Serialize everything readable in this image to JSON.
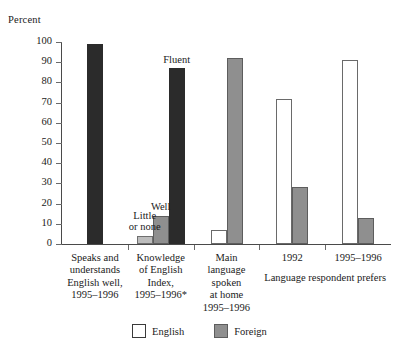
{
  "chart_data": {
    "type": "bar",
    "title": "",
    "xlabel": "",
    "ylabel": "Percent",
    "ylim": [
      0,
      100
    ],
    "yticks": [
      0,
      10,
      20,
      30,
      40,
      50,
      60,
      70,
      80,
      90,
      100
    ],
    "ytick_labels": [
      "0",
      "10",
      "20",
      "30",
      "40",
      "50",
      "60",
      "70",
      "80",
      "90",
      "100"
    ],
    "grid": false,
    "legend_position": "bottom-center",
    "legend": [
      {
        "name": "English",
        "color": "#ffffff"
      },
      {
        "name": "Foreign",
        "color": "#8f8f8f"
      }
    ],
    "categories": [
      "Speaks and understands English well, 1995–1996",
      "Knowledge of English Index, 1995–1996*",
      "Main language spoken at home 1995–1996",
      "1992",
      "1995–1996"
    ],
    "groups": [
      {
        "label_lines": [
          "Speaks and",
          "understands",
          "English well,",
          "1995–1996"
        ],
        "bars": [
          {
            "label": "",
            "value": 99,
            "style": "black"
          }
        ]
      },
      {
        "label_lines": [
          "Knowledge",
          "of English",
          "Index,",
          "1995–1996*"
        ],
        "bars": [
          {
            "label": "Little\nor none",
            "value": 4,
            "style": "lightgray"
          },
          {
            "label": "Well",
            "value": 14,
            "style": "gray"
          },
          {
            "label": "Fluent",
            "value": 87,
            "style": "black"
          }
        ]
      },
      {
        "label_lines": [
          "Main",
          "language",
          "spoken",
          "at home",
          "1995–1996"
        ],
        "bars": [
          {
            "label": "",
            "value": 7,
            "style": "white"
          },
          {
            "label": "",
            "value": 92,
            "style": "gray"
          }
        ]
      },
      {
        "label_lines": [
          "1992"
        ],
        "bars": [
          {
            "label": "",
            "value": 72,
            "style": "white"
          },
          {
            "label": "",
            "value": 28,
            "style": "gray"
          }
        ]
      },
      {
        "label_lines": [
          "1995–1996"
        ],
        "bars": [
          {
            "label": "",
            "value": 91,
            "style": "white"
          },
          {
            "label": "",
            "value": 13,
            "style": "gray"
          }
        ]
      }
    ],
    "annotations": [
      {
        "text": "Little\nor none",
        "for": "Little or none bar"
      },
      {
        "text": "Well",
        "for": "Well bar"
      },
      {
        "text": "Fluent",
        "for": "Fluent bar"
      },
      {
        "text": "Language respondent prefers",
        "for": "groups 1992 and 1995–1996"
      }
    ]
  },
  "axis": {
    "y_title": "Percent"
  },
  "bottom_group_label": "Language respondent prefers"
}
